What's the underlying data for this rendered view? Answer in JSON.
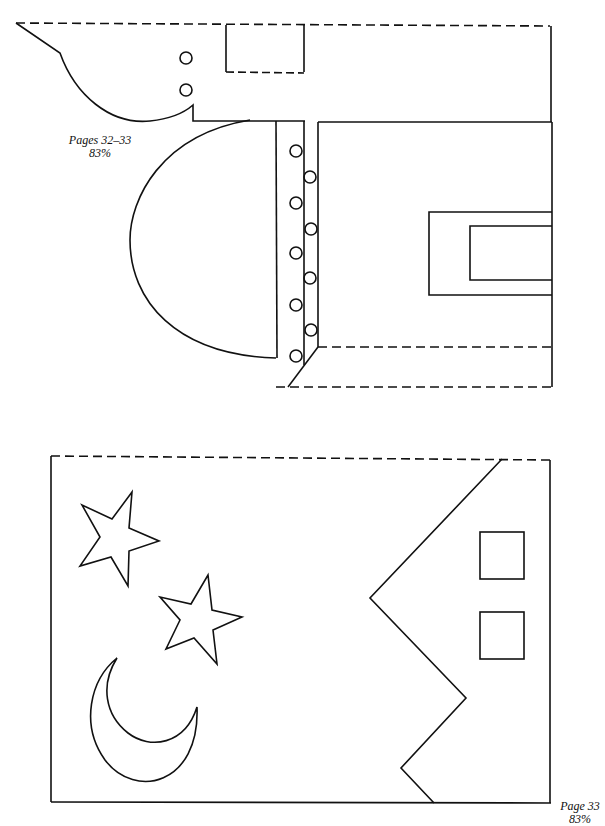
{
  "page": {
    "background": "#ffffff",
    "line_color": "#111111"
  },
  "template_top": {
    "caption": {
      "pages": "Pages 32–33",
      "scale": "83%"
    },
    "shapes": [
      "dashed-top-edge",
      "dashed-tab-rectangle",
      "curved-left-edge",
      "half-circle",
      "vertical-strip-with-circles",
      "inner-window-frame",
      "dashed-bottom-edge"
    ]
  },
  "template_bottom": {
    "caption": {
      "pages": "Page 33",
      "scale": "83%"
    },
    "shapes": [
      "star-large",
      "star-small",
      "crescent-moon",
      "zigzag-building-edge",
      "window-upper",
      "window-lower"
    ]
  }
}
